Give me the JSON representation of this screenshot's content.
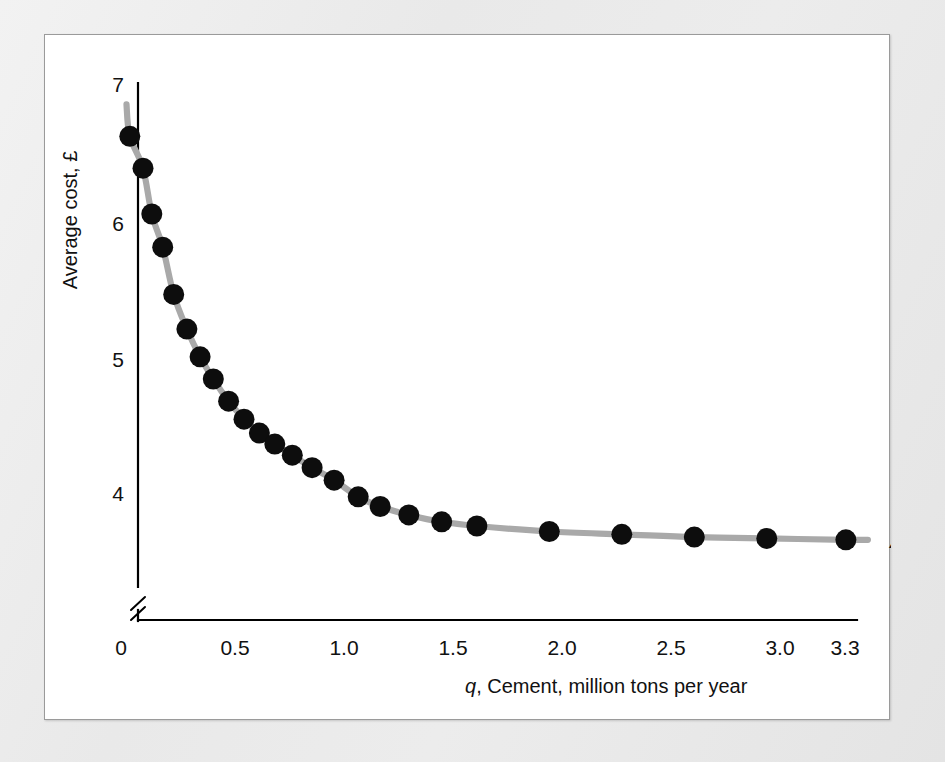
{
  "figure": {
    "panel_background": "#ffffff",
    "page_background": "#ededed",
    "border_color": "#9a9a9a"
  },
  "chart_data": {
    "type": "line",
    "title": "",
    "subtitle": "",
    "xlabel_prefix": "q",
    "xlabel_rest": ", Cement, million tons per year",
    "xlabel": "q, Cement, million tons per year",
    "ylabel": "Average cost, £",
    "xlim": [
      0,
      3.45
    ],
    "ylim": [
      3.45,
      7.25
    ],
    "y_axis_broken": true,
    "y_break_note": "axis break between 0 and first shown value",
    "grid": false,
    "legend_position": "right-end-of-curve",
    "xticks": [
      "0",
      "0.5",
      "1.0",
      "1.5",
      "2.0",
      "2.5",
      "3.0",
      "3.3"
    ],
    "xtick_values": [
      0,
      0.5,
      1.0,
      1.5,
      2.0,
      2.5,
      3.0,
      3.3
    ],
    "yticks": [
      "7",
      "6",
      "5",
      "4"
    ],
    "ytick_values": [
      7,
      6,
      5,
      4
    ],
    "curve_color": "#a9a9a9",
    "point_color": "#0d0d0d",
    "series": [
      {
        "name": "AC",
        "label": "AC",
        "x": [
          0.04,
          0.1,
          0.14,
          0.19,
          0.24,
          0.3,
          0.36,
          0.42,
          0.49,
          0.56,
          0.63,
          0.7,
          0.78,
          0.87,
          0.97,
          1.08,
          1.18,
          1.31,
          1.46,
          1.62,
          1.95,
          2.28,
          2.61,
          2.94,
          3.3
        ],
        "y": [
          6.63,
          6.4,
          6.07,
          5.83,
          5.49,
          5.24,
          5.04,
          4.88,
          4.72,
          4.59,
          4.49,
          4.41,
          4.33,
          4.24,
          4.15,
          4.03,
          3.96,
          3.9,
          3.85,
          3.82,
          3.78,
          3.76,
          3.74,
          3.73,
          3.72
        ]
      }
    ],
    "curve_endpoints": {
      "left_top": {
        "x": 0.025,
        "y": 6.86
      },
      "right_end": {
        "x": 3.4,
        "y": 3.72
      }
    }
  },
  "labels": {
    "y_axis_title": "Average cost, £",
    "x_axis_title_italic": "q",
    "x_axis_title_plain": ", Cement, million tons per year",
    "series_label_ac": "AC",
    "y_tick_7": "7",
    "y_tick_6": "6",
    "y_tick_5": "5",
    "y_tick_4": "4",
    "x_tick_0": "0",
    "x_tick_05": "0.5",
    "x_tick_10": "1.0",
    "x_tick_15": "1.5",
    "x_tick_20": "2.0",
    "x_tick_25": "2.5",
    "x_tick_30": "3.0",
    "x_tick_33": "3.3"
  }
}
